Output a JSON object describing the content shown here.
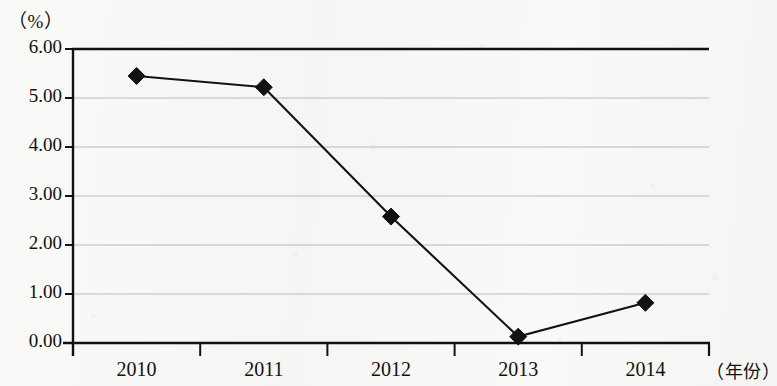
{
  "chart_data": {
    "type": "line",
    "title": "",
    "subtitle": "",
    "xlabel": "（年份）",
    "ylabel": "（%）",
    "categories": [
      "2010",
      "2011",
      "2012",
      "2013",
      "2014"
    ],
    "values": [
      5.45,
      5.22,
      2.58,
      0.13,
      0.82
    ],
    "series": [
      {
        "name": "",
        "values": [
          5.45,
          5.22,
          2.58,
          0.13,
          0.82
        ]
      }
    ],
    "ylim": [
      0.0,
      6.0
    ],
    "ytick_step": 1.0,
    "ytick_labels": [
      "6.00",
      "5.00",
      "4.00",
      "3.00",
      "2.00",
      "1.00",
      "0.00"
    ],
    "ytick_values": [
      6.0,
      5.0,
      4.0,
      3.0,
      2.0,
      1.0,
      0.0
    ],
    "xtick_labels": [
      "2010",
      "2011",
      "2012",
      "2013",
      "2014"
    ],
    "grid": true,
    "grid_axis": "y",
    "legend": false,
    "legend_position": "none",
    "marker": "diamond",
    "marker_color": "#121212",
    "line_color": "#121212",
    "grid_color": "#b9b9b9",
    "axis_color": "#121212",
    "background_color": "#f8f8f6",
    "annotations": []
  },
  "axes": {
    "y_unit_label": "（%）",
    "x_unit_label": "（年份）"
  }
}
